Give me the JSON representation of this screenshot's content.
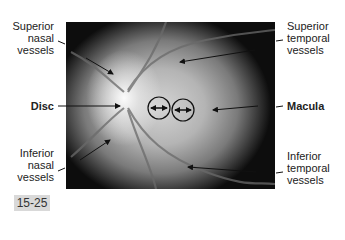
{
  "figure": {
    "number": "15-25",
    "image_description": "Fundus photograph of the retina showing optic disc, macula and vessels"
  },
  "labels": {
    "superior_nasal": [
      "Superior",
      "nasal",
      "vessels"
    ],
    "disc": "Disc",
    "inferior_nasal": [
      "Inferior",
      "nasal",
      "vessels"
    ],
    "superior_temporal": [
      "Superior",
      "temporal",
      "vessels"
    ],
    "macula": "Macula",
    "inferior_temporal": [
      "Inferior",
      "temporal",
      "vessels"
    ]
  },
  "colors": {
    "background": "#ffffff",
    "figure_badge": "#d9d9d9",
    "text": "#222222"
  }
}
